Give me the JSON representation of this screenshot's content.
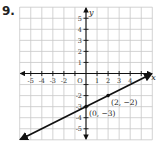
{
  "problem": {
    "number": "9."
  },
  "chart_data": {
    "type": "line",
    "title": "",
    "xlabel": "x",
    "ylabel": "y",
    "xlim": [
      -6,
      6
    ],
    "ylim": [
      -6,
      6
    ],
    "grid": true,
    "x_tick_labels": [
      "-5",
      "-4",
      "-3",
      "-2",
      "O",
      "1",
      "2",
      "3",
      "4"
    ],
    "y_tick_labels": [
      "5",
      "4",
      "3",
      "2",
      "1",
      "-2",
      "-3",
      "-4",
      "-5"
    ],
    "series": [
      {
        "name": "line",
        "slope": 0.5,
        "intercept": -3,
        "x": [
          -6,
          6
        ],
        "y": [
          -6,
          0
        ],
        "arrows": "both"
      }
    ],
    "points": [
      {
        "x": 0,
        "y": -3,
        "label": "(0, −3)"
      },
      {
        "x": 2,
        "y": -2,
        "label": "(2, −2)"
      }
    ]
  },
  "colors": {
    "grid": "#c8c8c8",
    "axis": "#111111",
    "line": "#111111"
  }
}
